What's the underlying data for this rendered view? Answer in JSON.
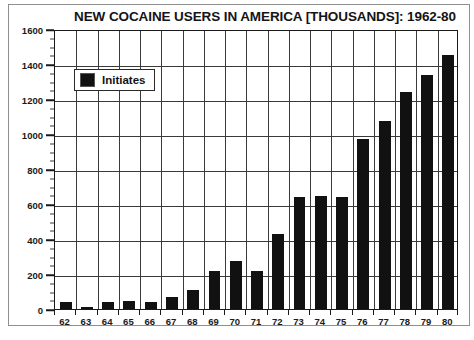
{
  "chart_data": {
    "type": "bar",
    "title": "NEW COCAINE USERS IN AMERICA [THOUSANDS]: 1962-80",
    "xlabel": "",
    "ylabel": "",
    "ylim": [
      0,
      1600
    ],
    "ytick_step": 200,
    "yminor_step": 50,
    "grid": true,
    "legend_position": "top-left",
    "categories": [
      "62",
      "63",
      "64",
      "65",
      "66",
      "67",
      "68",
      "69",
      "70",
      "71",
      "72",
      "73",
      "74",
      "75",
      "76",
      "77",
      "78",
      "79",
      "80"
    ],
    "series": [
      {
        "name": "Initiates",
        "color": "#111111",
        "values": [
          40,
          10,
          40,
          45,
          40,
          70,
          110,
          215,
          275,
          220,
          430,
          640,
          645,
          640,
          970,
          1075,
          1240,
          1340,
          1450
        ]
      }
    ],
    "yticks": [
      "1600",
      "1400",
      "1200",
      "1000",
      "800",
      "600",
      "400",
      "200",
      "0"
    ]
  },
  "legend": {
    "label": "Initiates",
    "swatch_name": "legend-swatch-initiates"
  },
  "caption": {
    "text": ""
  },
  "colors": {
    "bar": "#111111",
    "axis": "#1a1a1a",
    "grid": "#3a3a3a",
    "frame": "#8f8f8f",
    "background": "#ffffff"
  }
}
